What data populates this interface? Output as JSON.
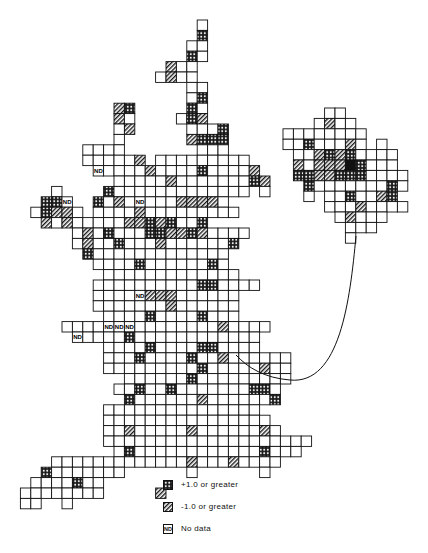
{
  "figure": {
    "cell_size": 10.4,
    "colors": {
      "line": "#111111",
      "fill": "#ffffff",
      "pattern": "#222222"
    },
    "cell_codes": {
      "o": "plain",
      "x": "+1.0 or greater (cross-hatch)",
      "s": "-1.0 or greater (diagonal stripe)",
      "n": "No data (ND)",
      "b": "solid black"
    }
  },
  "main_map": {
    "origin": [
      10,
      20
    ],
    "rows": [
      "..................o.........",
      "..................x.........",
      ".................oo.........",
      ".................xo.........",
      "...............soo..........",
      "..............osoo..........",
      ".................oo.........",
      ".................ox.........",
      "..........sx.....xo.........",
      "..........so....oxs.........",
      "..........os.....ooox.......",
      "..........o......sxxx.......",
      ".......oooo.......ooo.......",
      ".......ooooos.ooooooooo.....",
      "........noooosooooxoooos....",
      "..........ooooosoooooooxs...",
      "....o....xooooooooooooo.o...",
      "...xxn..xosonooosssso.......",
      "..oxsso.oooosooooooooo......",
      "...sosooooossxsxoox.........",
      "......osoxoooxxssxsoooo.....",
      "......osooxooosoooooox......",
      ".......xooooooooooooo.......",
      "........ooooxooooooxo.......",
      ".........ooooooooooooo......",
      "........ooooooooooxxoooo....",
      "........oooonsssoooooo......",
      "........ooooooosoooooo......",
      ".........ooooxooooxooo......",
      ".....oooonnnoooooooosoooo...",
      "......nooooxoooooooooooo....",
      ".........ooooxooooxxoooo....",
      ".........oooxooooxoosoooooo.",
      ".........oooooooooxooooosoo.",
      "...........ooooooxooooooooo.",
      "..........ooxooxoooooooxxo..",
      "...........xoooooosoooooox..",
      ".........ooooooooooooooo....",
      ".........oooooooooooooooo...",
      ".........oosooooosooooooso..",
      ".........oooooooooooooooooooo",
      "..........oxooooooooooooxooo",
      "....ooooooooooooosooosoooo..",
      "...xooooooo......o......o...",
      "..ooooxoo...................",
      ".oooooooo.....s.............",
      ".oo..o......................"
    ]
  },
  "inset_map": {
    "origin": [
      283,
      108
    ],
    "rows": [
      "....oo......",
      "...osoo.....",
      "oooooooo....",
      "ooxoooso.o..",
      ".oosxsxoooo.",
      ".sosssbxooo.",
      ".xxssxxxoooo",
      "..xoooooooxo",
      "..o.ooxoosx.",
      "....ooosoooo",
      ".....osooo..",
      "......ooo...",
      "......o....."
    ]
  },
  "legend": {
    "items": [
      {
        "symbol": "cross-hatch",
        "label": "+1.0 or greater"
      },
      {
        "symbol": "diagonal-stripe",
        "label": "-1.0 or greater"
      },
      {
        "symbol": "ND",
        "label": "No data"
      }
    ]
  },
  "nd_label": "ND"
}
